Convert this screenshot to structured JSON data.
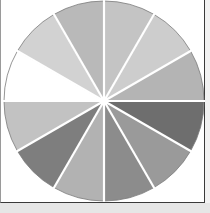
{
  "figure": {
    "title": "",
    "type": "gray-value wheel",
    "segments": 12,
    "center": [
      104,
      101
    ],
    "radius": 100,
    "separator_color": "#ffffff",
    "outline_color": "#7a7a7a",
    "slices": [
      {
        "index": 0,
        "start_deg": 0,
        "fill": "#c4c4c4"
      },
      {
        "index": 1,
        "start_deg": 30,
        "fill": "#cdcdcd"
      },
      {
        "index": 2,
        "start_deg": 60,
        "fill": "#b4b4b4"
      },
      {
        "index": 3,
        "start_deg": 90,
        "fill": "#6e6e6e"
      },
      {
        "index": 4,
        "start_deg": 120,
        "fill": "#9a9a9a"
      },
      {
        "index": 5,
        "start_deg": 150,
        "fill": "#8c8c8c"
      },
      {
        "index": 6,
        "start_deg": 180,
        "fill": "#b2b2b2"
      },
      {
        "index": 7,
        "start_deg": 210,
        "fill": "#7e7e7e"
      },
      {
        "index": 8,
        "start_deg": 240,
        "fill": "#c2c2c2"
      },
      {
        "index": 9,
        "start_deg": 270,
        "fill": "#ffffff"
      },
      {
        "index": 10,
        "start_deg": 300,
        "fill": "#d2d2d2"
      },
      {
        "index": 11,
        "start_deg": 330,
        "fill": "#b9b9b9"
      }
    ]
  }
}
